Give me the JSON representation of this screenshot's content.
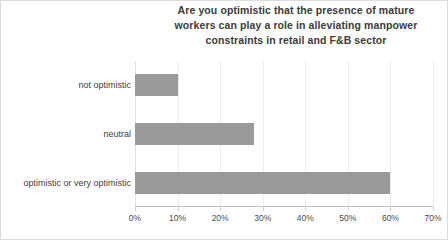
{
  "chart_data": {
    "type": "bar",
    "orientation": "horizontal",
    "title": "Are you optimistic that the presence of mature workers can play a role in alleviating manpower constraints in retail and F&B sector",
    "title_lines": [
      "Are you optimistic that the presence of mature",
      "workers can play a role in alleviating manpower",
      "constraints in retail and F&B sector"
    ],
    "categories": [
      "not optimistic",
      "neutral",
      "optimistic or very optimistic"
    ],
    "values": [
      10,
      28,
      60
    ],
    "value_unit": "%",
    "xlabel": "",
    "ylabel": "",
    "xlim": [
      0,
      70
    ],
    "xticks": [
      "0%",
      "10%",
      "20%",
      "30%",
      "40%",
      "50%",
      "60%",
      "70%"
    ],
    "xtick_values": [
      0,
      10,
      20,
      30,
      40,
      50,
      60,
      70
    ],
    "grid": "vertical",
    "legend": "none",
    "bar_color": "#9a9a9a",
    "gridline_color": "#ececec",
    "axis_color": "#bfbfbf",
    "title_color": "#3b3b3b",
    "label_color": "#404040",
    "background": "#ffffff"
  }
}
